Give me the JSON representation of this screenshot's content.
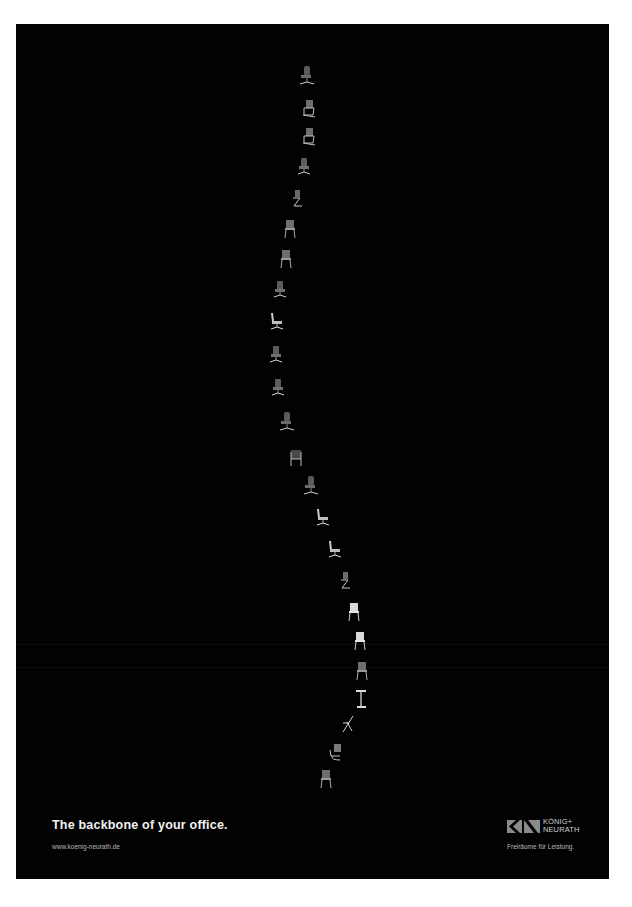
{
  "poster": {
    "background": "#020202",
    "headline": "The backbone of your office.",
    "url": "www.koenig-neurath.de",
    "brand": {
      "line1": "KÖNIG+",
      "line2": "NEURATH",
      "logo_icon": "kn-logo-icon"
    },
    "tagline": "Freiräume für Leistung."
  },
  "chairs": [
    {
      "type": "swivel-highback",
      "x": 298,
      "y": 66
    },
    {
      "type": "cantilever",
      "x": 300,
      "y": 100
    },
    {
      "type": "cantilever",
      "x": 300,
      "y": 128
    },
    {
      "type": "swivel",
      "x": 296,
      "y": 157
    },
    {
      "type": "cantilever-side",
      "x": 288,
      "y": 190
    },
    {
      "type": "four-leg",
      "x": 282,
      "y": 220
    },
    {
      "type": "four-leg",
      "x": 278,
      "y": 250
    },
    {
      "type": "swivel",
      "x": 272,
      "y": 280
    },
    {
      "type": "swivel-side",
      "x": 268,
      "y": 312
    },
    {
      "type": "swivel",
      "x": 268,
      "y": 345
    },
    {
      "type": "swivel",
      "x": 270,
      "y": 378
    },
    {
      "type": "swivel-highback",
      "x": 278,
      "y": 412
    },
    {
      "type": "sled",
      "x": 288,
      "y": 450
    },
    {
      "type": "swivel-highback",
      "x": 302,
      "y": 476
    },
    {
      "type": "swivel-side",
      "x": 314,
      "y": 508
    },
    {
      "type": "swivel-side",
      "x": 326,
      "y": 540
    },
    {
      "type": "cantilever-side",
      "x": 336,
      "y": 572
    },
    {
      "type": "four-leg-white",
      "x": 346,
      "y": 603
    },
    {
      "type": "four-leg-white",
      "x": 352,
      "y": 632
    },
    {
      "type": "four-leg",
      "x": 354,
      "y": 662
    },
    {
      "type": "stool",
      "x": 354,
      "y": 690
    },
    {
      "type": "folding",
      "x": 340,
      "y": 716
    },
    {
      "type": "cantilever-lounge",
      "x": 328,
      "y": 744
    },
    {
      "type": "four-leg",
      "x": 318,
      "y": 770
    }
  ]
}
